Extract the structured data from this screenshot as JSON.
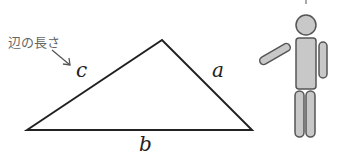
{
  "annotation": {
    "text": "辺の長さ"
  },
  "triangle": {
    "vertices": {
      "left": [
        27,
        130
      ],
      "top": [
        162,
        40
      ],
      "right": [
        252,
        130
      ]
    },
    "labels": {
      "a": "a",
      "b": "b",
      "c": "c"
    },
    "stroke_color": "#222222"
  },
  "figure": {
    "fill_color": "#c8c8c8",
    "outline_color": "#555555"
  }
}
